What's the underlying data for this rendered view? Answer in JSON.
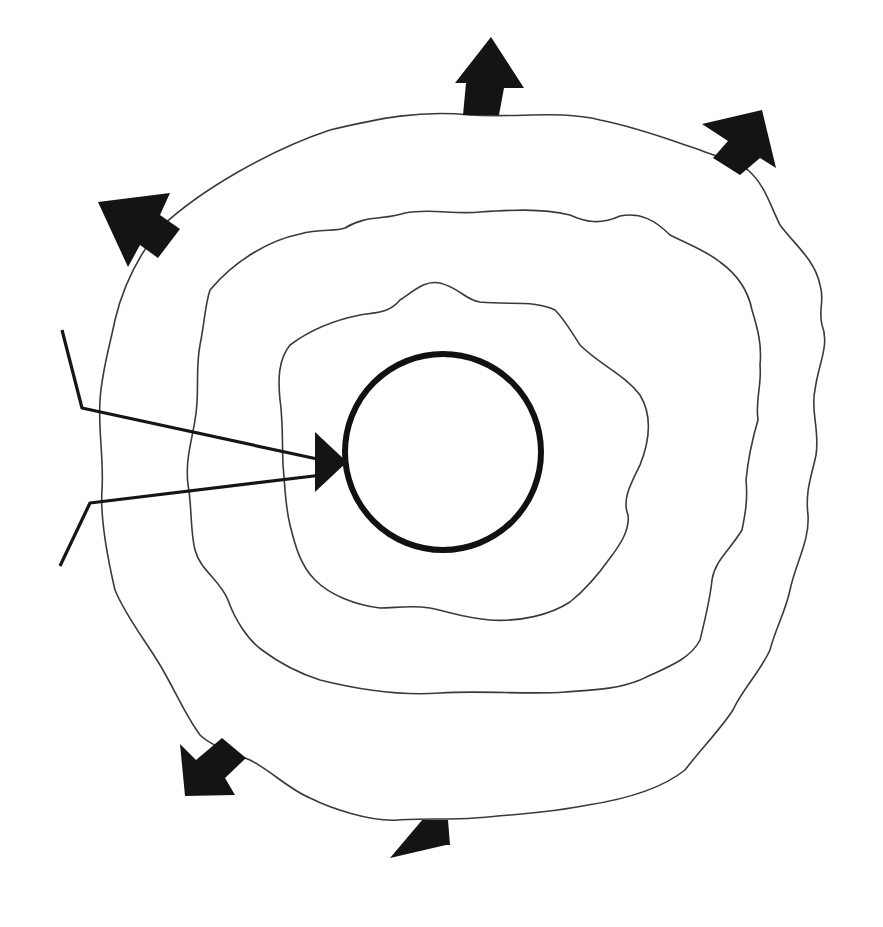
{
  "diagram": {
    "type": "concentric-layers",
    "colors": {
      "line": "#3a3a3a",
      "fill_arrows": "#141414",
      "text": "#2a2a2a",
      "background": "#ffffff"
    },
    "core": {
      "line1": "MANAGEMENT",
      "line2": "VALUES",
      "line3": "AND",
      "line4": "EXPECTATIONS",
      "underlined": [
        "VALUES",
        "EXPECTATIONS"
      ]
    },
    "layers": {
      "philosophy": {
        "top_line1": "MANAGEMENT",
        "top_line2": "PHILOSOPHY",
        "bottom_line1": "MANAGEMENT",
        "bottom_line2": "PHILOSOPHY"
      },
      "processes": {
        "top": "MANAGEMENT PROCESSES",
        "bottom": "MANAGEMENT PROCESSES"
      },
      "skills": {
        "top": "MANAGEMENT SKILLS",
        "bottom": "MANAGEMENT SKILLS"
      }
    },
    "outer": {
      "top_left": "MANAGER ACTIONS",
      "bottom_right": "MANAGER ACTIONS"
    },
    "evaluation": {
      "label": "EVALUATION",
      "letters": [
        "E",
        "V",
        "A",
        "L",
        "U",
        "A",
        "T",
        "I",
        "O",
        "N"
      ]
    },
    "outward_arrows": [
      "top",
      "top-right",
      "top-left",
      "bottom-left",
      "bottom",
      "bottom-right"
    ]
  }
}
